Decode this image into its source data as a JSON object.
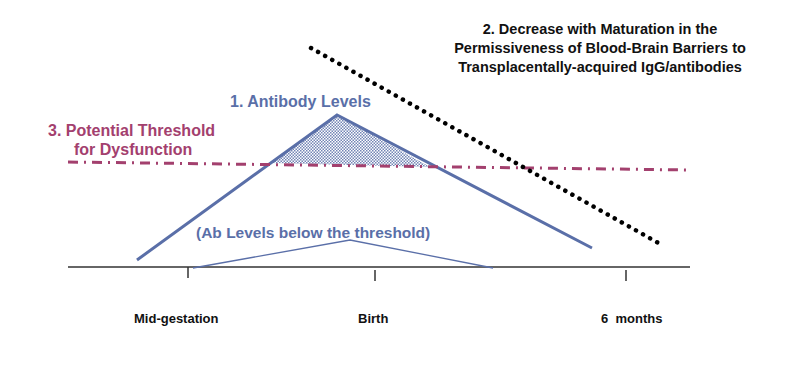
{
  "diagram": {
    "labels": {
      "antibody_levels": "1. Antibody Levels",
      "decrease_title": "2. Decrease with Maturation in the Permissiveness of Blood-Brain Barriers to Transplacentally-acquired IgG/antibodies",
      "threshold_line1": "3. Potential Threshold",
      "threshold_line2": "for Dysfunction",
      "below_threshold": "(Ab Levels below the threshold)"
    },
    "axis": {
      "ticks": [
        "Mid-gestation",
        "Birth",
        "6  months"
      ]
    },
    "colors": {
      "antibody": "#5a6fa8",
      "threshold": "#a3406e",
      "bbb_dotted": "#000000",
      "axis": "#333333"
    }
  }
}
